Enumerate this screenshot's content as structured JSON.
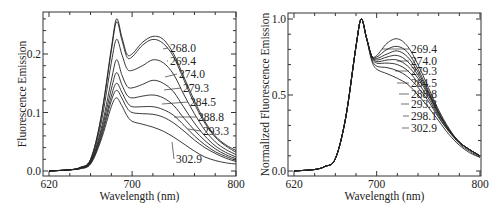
{
  "chart_data": [
    {
      "type": "line",
      "title": "",
      "xlabel": "Wavelength (nm)",
      "ylabel": "Fluorescence Emission",
      "xlim": [
        620,
        800
      ],
      "ylim": [
        0.0,
        0.27
      ],
      "x_ticks": [
        "620",
        "700",
        "800"
      ],
      "y_ticks": [
        "0.0",
        "0.1",
        "0.2"
      ],
      "grid": false,
      "legend_position": "inline labels at right",
      "x": [
        620,
        640,
        650,
        660,
        670,
        680,
        685,
        690,
        695,
        700,
        710,
        720,
        730,
        740,
        750,
        760,
        770,
        780,
        790,
        800
      ],
      "series": [
        {
          "name": "268.0",
          "values": [
            0.0,
            0.002,
            0.006,
            0.02,
            0.09,
            0.21,
            0.26,
            0.23,
            0.2,
            0.2,
            0.22,
            0.23,
            0.225,
            0.2,
            0.16,
            0.12,
            0.085,
            0.06,
            0.045,
            0.035
          ]
        },
        {
          "name": "269.4",
          "values": [
            0.0,
            0.002,
            0.006,
            0.02,
            0.09,
            0.205,
            0.255,
            0.225,
            0.195,
            0.195,
            0.215,
            0.225,
            0.218,
            0.195,
            0.155,
            0.115,
            0.082,
            0.058,
            0.043,
            0.032
          ]
        },
        {
          "name": "274.0",
          "values": [
            0.0,
            0.002,
            0.006,
            0.018,
            0.08,
            0.185,
            0.225,
            0.2,
            0.175,
            0.172,
            0.18,
            0.19,
            0.185,
            0.165,
            0.13,
            0.098,
            0.07,
            0.05,
            0.037,
            0.028
          ]
        },
        {
          "name": "279.3",
          "values": [
            0.0,
            0.002,
            0.005,
            0.016,
            0.07,
            0.155,
            0.19,
            0.165,
            0.145,
            0.142,
            0.148,
            0.155,
            0.15,
            0.135,
            0.108,
            0.082,
            0.06,
            0.043,
            0.032,
            0.024
          ]
        },
        {
          "name": "284.5",
          "values": [
            0.0,
            0.002,
            0.005,
            0.015,
            0.065,
            0.14,
            0.168,
            0.148,
            0.13,
            0.125,
            0.128,
            0.13,
            0.125,
            0.112,
            0.09,
            0.07,
            0.052,
            0.038,
            0.028,
            0.021
          ]
        },
        {
          "name": "288.8",
          "values": [
            0.0,
            0.002,
            0.005,
            0.014,
            0.06,
            0.128,
            0.15,
            0.135,
            0.118,
            0.11,
            0.11,
            0.11,
            0.105,
            0.095,
            0.078,
            0.06,
            0.045,
            0.033,
            0.025,
            0.018
          ]
        },
        {
          "name": "293.3",
          "values": [
            0.0,
            0.002,
            0.004,
            0.013,
            0.056,
            0.12,
            0.138,
            0.125,
            0.108,
            0.1,
            0.098,
            0.097,
            0.092,
            0.082,
            0.068,
            0.053,
            0.04,
            0.03,
            0.022,
            0.016
          ]
        },
        {
          "name": "302.9",
          "values": [
            0.0,
            0.002,
            0.004,
            0.012,
            0.052,
            0.11,
            0.125,
            0.112,
            0.095,
            0.085,
            0.08,
            0.075,
            0.068,
            0.058,
            0.046,
            0.034,
            0.024,
            0.018,
            0.014,
            0.012
          ]
        }
      ]
    },
    {
      "type": "line",
      "title": "",
      "xlabel": "Wavelength (nm)",
      "ylabel": "Normalized Fluorescence Emission",
      "xlim": [
        620,
        800
      ],
      "ylim": [
        0.0,
        1.05
      ],
      "x_ticks": [
        "620",
        "700",
        "800"
      ],
      "y_ticks": [
        "0.0",
        "0.5",
        "1.0"
      ],
      "grid": false,
      "legend_position": "inline labels at right",
      "x": [
        620,
        640,
        650,
        660,
        670,
        680,
        685,
        690,
        695,
        700,
        710,
        720,
        730,
        740,
        750,
        760,
        770,
        780,
        790,
        800
      ],
      "series": [
        {
          "name": "269.4",
          "values": [
            0.0,
            0.01,
            0.03,
            0.08,
            0.35,
            0.82,
            1.0,
            0.88,
            0.76,
            0.76,
            0.84,
            0.87,
            0.82,
            0.7,
            0.55,
            0.4,
            0.28,
            0.19,
            0.14,
            0.1
          ]
        },
        {
          "name": "274.0",
          "values": [
            0.0,
            0.01,
            0.03,
            0.08,
            0.35,
            0.82,
            1.0,
            0.88,
            0.76,
            0.75,
            0.8,
            0.82,
            0.78,
            0.67,
            0.53,
            0.39,
            0.27,
            0.19,
            0.14,
            0.1
          ]
        },
        {
          "name": "279.3",
          "values": [
            0.0,
            0.01,
            0.03,
            0.08,
            0.35,
            0.82,
            1.0,
            0.88,
            0.76,
            0.74,
            0.77,
            0.79,
            0.75,
            0.65,
            0.52,
            0.38,
            0.27,
            0.19,
            0.14,
            0.1
          ]
        },
        {
          "name": "284.5",
          "values": [
            0.0,
            0.01,
            0.03,
            0.08,
            0.35,
            0.82,
            1.0,
            0.88,
            0.76,
            0.73,
            0.75,
            0.76,
            0.72,
            0.63,
            0.51,
            0.38,
            0.27,
            0.19,
            0.14,
            0.1
          ]
        },
        {
          "name": "288.8",
          "values": [
            0.0,
            0.01,
            0.03,
            0.08,
            0.35,
            0.82,
            1.0,
            0.88,
            0.76,
            0.72,
            0.73,
            0.73,
            0.69,
            0.61,
            0.5,
            0.37,
            0.27,
            0.19,
            0.14,
            0.1
          ]
        },
        {
          "name": "293.3",
          "values": [
            0.0,
            0.01,
            0.03,
            0.08,
            0.35,
            0.82,
            1.0,
            0.88,
            0.75,
            0.71,
            0.71,
            0.7,
            0.66,
            0.58,
            0.48,
            0.36,
            0.26,
            0.19,
            0.14,
            0.1
          ]
        },
        {
          "name": "298.1",
          "values": [
            0.0,
            0.01,
            0.03,
            0.08,
            0.35,
            0.82,
            1.0,
            0.88,
            0.74,
            0.69,
            0.68,
            0.66,
            0.62,
            0.55,
            0.46,
            0.35,
            0.26,
            0.18,
            0.13,
            0.09
          ]
        },
        {
          "name": "302.9",
          "values": [
            0.0,
            0.01,
            0.03,
            0.08,
            0.35,
            0.82,
            1.0,
            0.88,
            0.73,
            0.67,
            0.64,
            0.61,
            0.57,
            0.5,
            0.42,
            0.33,
            0.24,
            0.17,
            0.12,
            0.09
          ]
        }
      ]
    }
  ],
  "panels": [
    {
      "xlabel": "Wavelength   (nm)",
      "ylabel": "Fluorescence  Emission"
    },
    {
      "xlabel": "Wavelength   (nm)",
      "ylabel": "Normalized  Fluorescence  Emission"
    }
  ]
}
